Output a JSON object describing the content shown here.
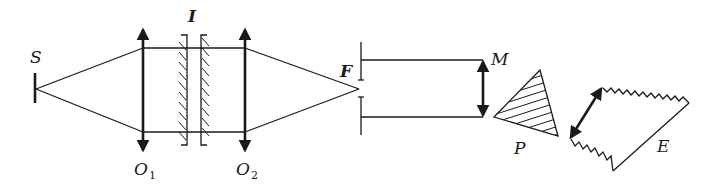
{
  "figure": {
    "colors": {
      "ink": "#1a1a1a",
      "background": "#ffffff"
    }
  },
  "labels": {
    "source": "S",
    "interferometer": "I",
    "lens1_main": "O",
    "lens1_sub": "1",
    "lens2_main": "O",
    "lens2_sub": "2",
    "slit": "F",
    "lens_m": "M",
    "prism": "P",
    "screen": "E"
  },
  "components": [
    {
      "id": "S",
      "type": "source"
    },
    {
      "id": "O1",
      "type": "converging-lens"
    },
    {
      "id": "I",
      "type": "interferometer-mirror-pair"
    },
    {
      "id": "O2",
      "type": "converging-lens"
    },
    {
      "id": "F",
      "type": "slit"
    },
    {
      "id": "M",
      "type": "converging-lens"
    },
    {
      "id": "P",
      "type": "prism"
    },
    {
      "id": "E",
      "type": "screen"
    }
  ]
}
